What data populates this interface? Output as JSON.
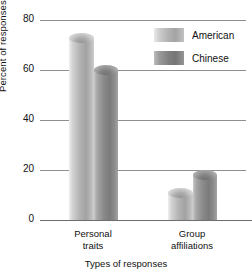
{
  "chart_data": {
    "type": "bar",
    "title": "",
    "xlabel": "Types of responses",
    "ylabel": "Percent of responses",
    "categories": [
      "Personal traits",
      "Group affiliations"
    ],
    "category_lines": [
      [
        "Personal",
        "traits"
      ],
      [
        "Group",
        "affiliations"
      ]
    ],
    "series": [
      {
        "name": "American",
        "values": [
          75,
          13
        ],
        "color": "#b0b0b0"
      },
      {
        "name": "Chinese",
        "values": [
          62,
          20
        ],
        "color": "#828282"
      }
    ],
    "ylim": [
      0,
      80
    ],
    "yticks": [
      0,
      20,
      40,
      60,
      80
    ],
    "ytick_labels": [
      "0",
      "20",
      "40",
      "60",
      "80"
    ],
    "grid": true,
    "legend_position": "top-right",
    "bar_style": "cylinder"
  },
  "legend": {
    "entries": [
      {
        "label": "American",
        "swatch": "american-swatch"
      },
      {
        "label": "Chinese",
        "swatch": "chinese-swatch"
      }
    ]
  }
}
